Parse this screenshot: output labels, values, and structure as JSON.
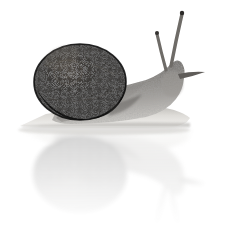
{
  "image": {
    "subject": "snail",
    "description": "Grayscale photograph of a garden snail with a dark mottled spiral shell, crawling on a reflective white surface, with its mirrored reflection beneath it.",
    "orientation": "facing-right",
    "background_color": "#ffffff",
    "width": 234,
    "height": 227,
    "color_mode": "grayscale"
  },
  "palette": {
    "background": "#ffffff",
    "shell_dark": "#131313",
    "shell_mid": "#2e2e2e",
    "shell_highlight": "#6b6b6b",
    "shell_rim": "#0a0a0a",
    "body_dark": "#5e5e5e",
    "body_mid": "#8b8b8b",
    "body_light": "#b4b4b4",
    "foot_light": "#cfcfcf",
    "foot_pale": "#ededed",
    "tentacle": "#6f6f6f",
    "tentacle_tip": "#2a2a2a",
    "reflection_light": "#e6e6e6",
    "reflection_mid": "#d4d4d4",
    "reflection_dark": "#c4c4c4",
    "shadow": "#bdbdbd"
  },
  "parts": {
    "shell": {
      "label": "Shell",
      "shape": "spiral-globose",
      "center_x": 80,
      "center_y": 82,
      "radius_x": 46,
      "radius_y": 38,
      "whorl_center_x": 70,
      "whorl_center_y": 74,
      "texture": "mottled-speckled"
    },
    "body": {
      "label": "Body",
      "extends_to_x": 192,
      "top_y": 62,
      "bottom_y": 120
    },
    "head": {
      "label": "Head",
      "x": 178,
      "y": 80
    },
    "upper_tentacle_left": {
      "label": "Left upper tentacle",
      "base_x": 163,
      "base_y": 66,
      "tip_x": 157,
      "tip_y": 32
    },
    "upper_tentacle_right": {
      "label": "Right upper tentacle",
      "base_x": 172,
      "base_y": 62,
      "tip_x": 182,
      "tip_y": 12
    },
    "lower_tentacle": {
      "label": "Lower tentacle",
      "base_x": 182,
      "base_y": 76,
      "tip_x": 204,
      "tip_y": 73
    },
    "foot": {
      "label": "Foot",
      "left_tip_x": 20,
      "right_x": 190,
      "baseline_y": 126
    },
    "reflection": {
      "label": "Reflection",
      "mirror_line_y": 128,
      "fade_bottom_y": 210,
      "opacity": 0.22
    }
  }
}
